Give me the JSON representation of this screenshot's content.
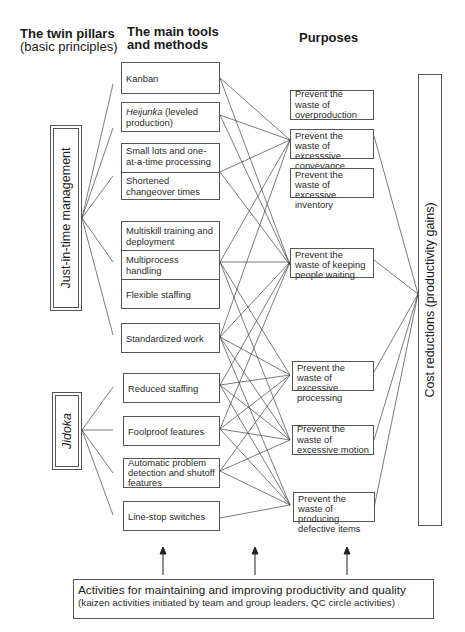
{
  "headers": {
    "pillars_title": "The twin pillars",
    "pillars_subtitle": "(basic principles)",
    "tools_title_line1": "The main tools",
    "tools_title_line2": "and methods",
    "purposes_title": "Purposes"
  },
  "pillars": [
    {
      "id": "jit",
      "label": "Just-in-time management",
      "italic": false
    },
    {
      "id": "jidoka",
      "label": "Jidoka",
      "italic": true
    }
  ],
  "tools": [
    {
      "id": "kanban",
      "label": "Kanban"
    },
    {
      "id": "heijunka",
      "label_italic": "Heijunka",
      "label_rest": " (leveled production)"
    },
    {
      "id": "small_lots",
      "label": "Small lots and one-at-a-time processing"
    },
    {
      "id": "changeover",
      "label": "Shortened changeover times"
    },
    {
      "id": "multiskill",
      "label": "Multiskill training and deployment"
    },
    {
      "id": "multiprocess",
      "label": "Multiprocess handling"
    },
    {
      "id": "flexible",
      "label": "Flexible staffing"
    },
    {
      "id": "standardized",
      "label": "Standardized work"
    },
    {
      "id": "reduced",
      "label": "Reduced staffing"
    },
    {
      "id": "foolproof",
      "label": "Foolproof features"
    },
    {
      "id": "autodetect",
      "label": "Automatic problem detection and shutoff features"
    },
    {
      "id": "linestop",
      "label": "Line-stop switches"
    }
  ],
  "purposes": [
    {
      "id": "overproduction",
      "label": "Prevent the waste of overproduction"
    },
    {
      "id": "conveyance",
      "label": "Prevent the waste of excesssive conveyance"
    },
    {
      "id": "inventory",
      "label": "Prevent the waste of excessive inventory"
    },
    {
      "id": "waiting",
      "label": "Prevent the waste of keeping people waiting"
    },
    {
      "id": "processing",
      "label": "Prevent the waste of excessive processing"
    },
    {
      "id": "motion",
      "label": "Prevent the waste of excessive motion"
    },
    {
      "id": "defective",
      "label": "Prevent the waste of producing defective items"
    }
  ],
  "outcome": {
    "label": "Cost reductions (productivity gains)"
  },
  "bottom": {
    "title": "Activities for maintaining and improving productivity and quality",
    "subtitle": "(kaizen activities initiated by team and group leaders, QC circle activities)"
  },
  "colors": {
    "line": "#444444",
    "border": "#555555",
    "text": "#2b2b2b"
  }
}
